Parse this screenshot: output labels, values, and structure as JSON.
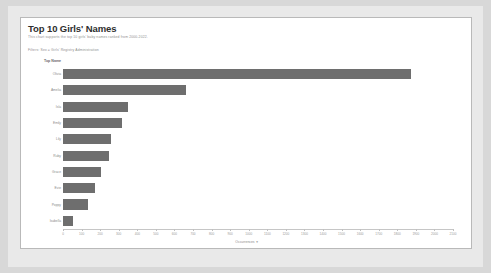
{
  "dashboard": {
    "title": "Top 10 Girls' Names",
    "subtitle": "This chart supports the top 10 girls' baby names ranked from 2000-2022.",
    "filter_note": "Filters: Sex = Girls' Registry Administration",
    "legend_label": "Top Name",
    "sort_icon": "sort-descending-icon"
  },
  "chart_data": {
    "type": "bar",
    "orientation": "horizontal",
    "title": "Top 10 Girls' Names",
    "xlabel": "Occurrences",
    "ylabel": "Top Name",
    "xlim": [
      0,
      2100
    ],
    "grid": false,
    "legend_position": "none",
    "bar_color": "#6e6e6e",
    "categories": [
      "Olivia",
      "Amelia",
      "Isla",
      "Emily",
      "Lily",
      "Ruby",
      "Grace",
      "Evie",
      "Poppy",
      "Isabella"
    ],
    "values": [
      1875,
      660,
      350,
      320,
      260,
      250,
      205,
      170,
      135,
      55
    ],
    "tick_values": [
      "0",
      "100",
      "200",
      "300",
      "400",
      "500",
      "600",
      "700",
      "800",
      "900",
      "1000",
      "1100",
      "1200",
      "1300",
      "1400",
      "1500",
      "1600",
      "1700",
      "1800",
      "1900",
      "2000",
      "2100"
    ]
  }
}
